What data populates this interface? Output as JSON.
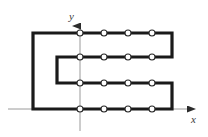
{
  "figure": {
    "title": "",
    "type": "physics-circuit-diagram",
    "background_color": "#ffffff",
    "axes": {
      "color": "#9a9a9a",
      "x_axis": {
        "label": "x",
        "label_position": {
          "x": 191,
          "y": 114
        },
        "y_pixel": 109,
        "x_start": 8,
        "x_end": 196,
        "arrow": "right"
      },
      "y_axis": {
        "label": "y",
        "label_position": {
          "x": 69,
          "y": 11
        },
        "x_pixel": 80,
        "y_start": 20,
        "y_end": 131,
        "arrow": "up"
      },
      "origin": {
        "x": 80,
        "y": 109
      }
    },
    "conductor": {
      "color": "#1a1a1a",
      "stroke_width": 3.2,
      "path_points": [
        {
          "x": 33,
          "y": 109
        },
        {
          "x": 33,
          "y": 33
        },
        {
          "x": 172,
          "y": 33
        },
        {
          "x": 172,
          "y": 57
        },
        {
          "x": 57,
          "y": 57
        },
        {
          "x": 57,
          "y": 83
        },
        {
          "x": 172,
          "y": 83
        },
        {
          "x": 172,
          "y": 109
        },
        {
          "x": 33,
          "y": 109
        }
      ],
      "segment_rows_y": [
        33,
        57,
        83,
        109
      ],
      "left_outer_x": 33,
      "left_inner_x": 57,
      "right_x": 172
    },
    "markers": {
      "shape": "circle",
      "fill": "#ffffff",
      "stroke": "#2a2a2a",
      "stroke_width": 1.1,
      "radius": 3.0,
      "count": 16,
      "description": "current-direction dots along horizontal conductor segments",
      "points": [
        {
          "x": 80,
          "y": 33
        },
        {
          "x": 104,
          "y": 33
        },
        {
          "x": 128,
          "y": 33
        },
        {
          "x": 152,
          "y": 33
        },
        {
          "x": 80,
          "y": 57
        },
        {
          "x": 104,
          "y": 57
        },
        {
          "x": 128,
          "y": 57
        },
        {
          "x": 152,
          "y": 57
        },
        {
          "x": 80,
          "y": 83
        },
        {
          "x": 104,
          "y": 83
        },
        {
          "x": 128,
          "y": 83
        },
        {
          "x": 152,
          "y": 83
        },
        {
          "x": 80,
          "y": 109
        },
        {
          "x": 104,
          "y": 109
        },
        {
          "x": 128,
          "y": 109
        },
        {
          "x": 152,
          "y": 109
        }
      ]
    }
  }
}
